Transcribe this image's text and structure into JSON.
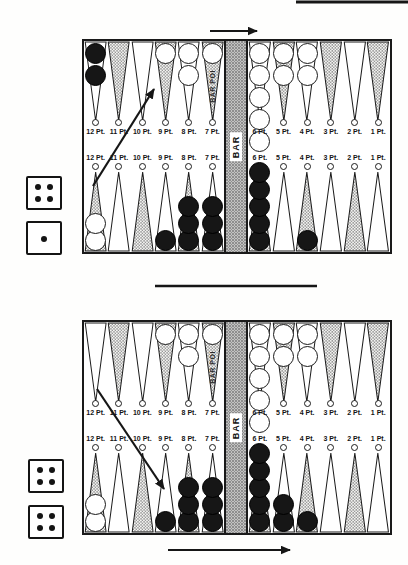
{
  "figure": {
    "bar_label": "BAR",
    "bar_point_label": "BAR POI"
  },
  "colors": {
    "ink": "#161616",
    "paper": "#fefefd",
    "stipple_dot": "#8e8e8e",
    "checker_black": "#161616",
    "checker_white": "#ffffff"
  },
  "boards": [
    {
      "name": "upper diagram",
      "dice": [
        4,
        1
      ],
      "top_points": [
        {
          "label": "12 Pt.",
          "shaded": false,
          "checkers": {
            "color": "black",
            "count": 2
          }
        },
        {
          "label": "11 Pt.",
          "shaded": true
        },
        {
          "label": "10 Pt.",
          "shaded": false
        },
        {
          "label": "9 Pt.",
          "shaded": true,
          "checkers": {
            "color": "white",
            "count": 1
          }
        },
        {
          "label": "8 Pt.",
          "shaded": false,
          "checkers": {
            "color": "white",
            "count": 2
          }
        },
        {
          "label": "7 Pt.",
          "shaded": true,
          "checkers": {
            "color": "white",
            "count": 1
          },
          "bar_point": true
        },
        {
          "label": "6 Pt.",
          "shaded": false,
          "checkers": {
            "color": "white",
            "count": 5
          }
        },
        {
          "label": "5 Pt.",
          "shaded": true,
          "checkers": {
            "color": "white",
            "count": 2
          }
        },
        {
          "label": "4 Pt.",
          "shaded": false,
          "checkers": {
            "color": "white",
            "count": 2
          }
        },
        {
          "label": "3 Pt.",
          "shaded": true
        },
        {
          "label": "2 Pt.",
          "shaded": false
        },
        {
          "label": "1 Pt.",
          "shaded": true
        }
      ],
      "bottom_points": [
        {
          "label": "12 Pt.",
          "shaded": true,
          "checkers": {
            "color": "white",
            "count": 2
          }
        },
        {
          "label": "11 Pt.",
          "shaded": false
        },
        {
          "label": "10 Pt.",
          "shaded": true
        },
        {
          "label": "9 Pt.",
          "shaded": false,
          "checkers": {
            "color": "black",
            "count": 1
          }
        },
        {
          "label": "8 Pt.",
          "shaded": true,
          "checkers": {
            "color": "black",
            "count": 3
          }
        },
        {
          "label": "7 Pt.",
          "shaded": false,
          "checkers": {
            "color": "black",
            "count": 3
          }
        },
        {
          "label": "6 Pt.",
          "shaded": true,
          "checkers": {
            "color": "black",
            "count": 5
          }
        },
        {
          "label": "5 Pt.",
          "shaded": false
        },
        {
          "label": "4 Pt.",
          "shaded": true,
          "checkers": {
            "color": "black",
            "count": 1
          }
        },
        {
          "label": "3 Pt.",
          "shaded": false
        },
        {
          "label": "2 Pt.",
          "shaded": true
        },
        {
          "label": "1 Pt.",
          "shaded": false
        }
      ]
    },
    {
      "name": "lower diagram",
      "dice": [
        4,
        4
      ],
      "top_points": [
        {
          "label": "12 Pt.",
          "shaded": false
        },
        {
          "label": "11 Pt.",
          "shaded": true
        },
        {
          "label": "10 Pt.",
          "shaded": false
        },
        {
          "label": "9 Pt.",
          "shaded": true,
          "checkers": {
            "color": "white",
            "count": 1
          }
        },
        {
          "label": "8 Pt.",
          "shaded": false,
          "checkers": {
            "color": "white",
            "count": 2
          }
        },
        {
          "label": "7 Pt.",
          "shaded": true,
          "checkers": {
            "color": "white",
            "count": 1
          },
          "bar_point": true
        },
        {
          "label": "6 Pt.",
          "shaded": false,
          "checkers": {
            "color": "white",
            "count": 5
          }
        },
        {
          "label": "5 Pt.",
          "shaded": true,
          "checkers": {
            "color": "white",
            "count": 2
          }
        },
        {
          "label": "4 Pt.",
          "shaded": false,
          "checkers": {
            "color": "white",
            "count": 2
          }
        },
        {
          "label": "3 Pt.",
          "shaded": true
        },
        {
          "label": "2 Pt.",
          "shaded": false
        },
        {
          "label": "1 Pt.",
          "shaded": true
        }
      ],
      "bottom_points": [
        {
          "label": "12 Pt.",
          "shaded": true,
          "checkers": {
            "color": "white",
            "count": 2
          }
        },
        {
          "label": "11 Pt.",
          "shaded": false
        },
        {
          "label": "10 Pt.",
          "shaded": true
        },
        {
          "label": "9 Pt.",
          "shaded": false,
          "checkers": {
            "color": "black",
            "count": 1
          }
        },
        {
          "label": "8 Pt.",
          "shaded": true,
          "checkers": {
            "color": "black",
            "count": 3
          }
        },
        {
          "label": "7 Pt.",
          "shaded": false,
          "checkers": {
            "color": "black",
            "count": 3
          }
        },
        {
          "label": "6 Pt.",
          "shaded": true,
          "checkers": {
            "color": "black",
            "count": 5
          }
        },
        {
          "label": "5 Pt.",
          "shaded": false,
          "checkers": {
            "color": "black",
            "count": 2
          }
        },
        {
          "label": "4 Pt.",
          "shaded": true,
          "checkers": {
            "color": "black",
            "count": 1
          }
        },
        {
          "label": "3 Pt.",
          "shaded": false
        },
        {
          "label": "2 Pt.",
          "shaded": true
        },
        {
          "label": "1 Pt.",
          "shaded": false
        }
      ]
    }
  ],
  "arrows": [
    {
      "name": "play-direction-arrow-upper",
      "x1": 210,
      "y1": 31,
      "x2": 257,
      "y2": 31
    },
    {
      "name": "move-arrow-upper",
      "x1": 93,
      "y1": 186,
      "x2": 154,
      "y2": 89
    },
    {
      "name": "move-arrow-lower",
      "x1": 97,
      "y1": 389,
      "x2": 164,
      "y2": 489
    },
    {
      "name": "play-direction-arrow-lower",
      "x1": 168,
      "y1": 550,
      "x2": 290,
      "y2": 550
    }
  ],
  "divider_line": {
    "x1": 155,
    "y1": 286,
    "x2": 317,
    "y2": 286
  },
  "top_edge_line": {
    "x1": 296,
    "y1": 2,
    "x2": 408,
    "y2": 2
  }
}
